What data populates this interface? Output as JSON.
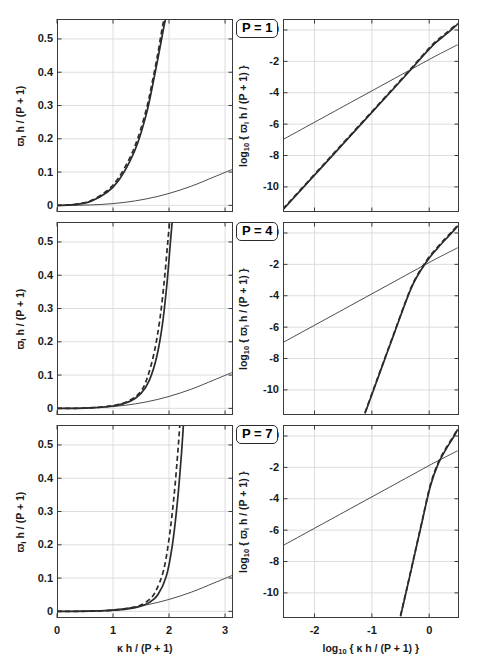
{
  "figure": {
    "title": "",
    "panel_labels": [
      "P = 1",
      "P = 4",
      "P = 7"
    ]
  },
  "axes": {
    "left": {
      "ylabel_html": "&#x3D6;<sub>i</sub> h / (P + 1)",
      "ylabel_plain": "w_i h / (P + 1)",
      "xlabel_html": "&#x3BA; h / (P + 1)",
      "xlabel_plain": "kappa h / (P + 1)",
      "xticks": [
        "0",
        "1",
        "2",
        "3"
      ],
      "yticks": [
        "0",
        "0.1",
        "0.2",
        "0.3",
        "0.4",
        "0.5"
      ],
      "xlim": [
        0,
        3.14159
      ],
      "ylim": [
        -0.02,
        0.56
      ]
    },
    "right": {
      "ylabel_html": "log<sub>10</sub> { &#x3D6;<sub>i</sub> h / (P + 1) }",
      "ylabel_plain": "log10 { w_i h / (P + 1) }",
      "xlabel_html": "log<sub>10</sub> { &#x3BA; h / (P + 1) }",
      "xlabel_plain": "log10 { kappa h / (P + 1) }",
      "xticks": [
        "-2",
        "-1",
        "0"
      ],
      "yticks": [
        "0",
        "-2",
        "-4",
        "-6",
        "-8",
        "-10"
      ],
      "xlim": [
        -2.55,
        0.52
      ],
      "ylim": [
        -11.6,
        0.7
      ]
    }
  },
  "chart_data": {
    "type": "line",
    "xlabel": "kappa h / (P + 1)",
    "ylabel": "w_i h / (P + 1)",
    "panels": [
      {
        "label": "P = 1",
        "linear": {
          "xlabel": "kappa h / (P + 1)",
          "ylabel": "w_i h / (P + 1)",
          "xlim": [
            0,
            3.14159
          ],
          "ylim": [
            -0.02,
            0.56
          ],
          "xticks": [
            0,
            1,
            2,
            3
          ],
          "yticks": [
            0,
            0.1,
            0.2,
            0.3,
            0.4,
            0.5
          ],
          "grid": true,
          "series": [
            {
              "name": "exact-shallow",
              "style": "solid-thin",
              "x": [
                0,
                0.4,
                0.8,
                1.2,
                1.6,
                2.0,
                2.4,
                2.8,
                3.14159
              ],
              "y": [
                0.0,
                0.0004,
                0.0028,
                0.0088,
                0.0195,
                0.0358,
                0.0578,
                0.0851,
                0.109
              ]
            },
            {
              "name": "approximation-solid",
              "style": "solid-bold",
              "x": [
                0,
                0.3,
                0.6,
                0.9,
                1.1,
                1.3,
                1.45,
                1.6,
                1.7,
                1.8,
                1.9,
                1.95
              ],
              "y": [
                0.0,
                0.002,
                0.012,
                0.04,
                0.075,
                0.132,
                0.192,
                0.278,
                0.355,
                0.44,
                0.53,
                0.57
              ]
            },
            {
              "name": "approximation-dashed",
              "style": "dashed",
              "x": [
                0,
                0.3,
                0.6,
                0.9,
                1.1,
                1.3,
                1.45,
                1.6,
                1.7,
                1.8,
                1.88,
                1.93
              ],
              "y": [
                0.0,
                0.0022,
                0.014,
                0.045,
                0.083,
                0.143,
                0.205,
                0.292,
                0.37,
                0.456,
                0.535,
                0.575
              ]
            }
          ]
        },
        "loglog": {
          "xlabel": "log10 { kappa h / (P + 1) }",
          "ylabel": "log10 { w_i h / (P + 1) }",
          "xlim": [
            -2.55,
            0.52
          ],
          "ylim": [
            -11.6,
            0.7
          ],
          "xticks": [
            -2,
            -1,
            0
          ],
          "yticks": [
            0,
            -2,
            -4,
            -6,
            -8,
            -10
          ],
          "grid": true,
          "series": [
            {
              "name": "exact-shallow",
              "style": "solid-thin",
              "slope": 2.0,
              "x": [
                -2.55,
                -1.5,
                -0.5,
                0.0,
                0.25,
                0.497
              ],
              "y": [
                -6.98,
                -4.88,
                -2.88,
                -1.88,
                -1.4,
                -0.94
              ]
            },
            {
              "name": "approximation-solid",
              "style": "solid-bold",
              "slope": 4.0,
              "x": [
                -2.55,
                -1.8,
                -1.0,
                -0.4,
                -0.1,
                0.1,
                0.3,
                0.497
              ],
              "y": [
                -11.45,
                -8.45,
                -5.25,
                -2.85,
                -1.62,
                -0.85,
                -0.25,
                0.38
              ]
            },
            {
              "name": "approximation-dashed",
              "style": "dashed",
              "slope": 4.0,
              "x": [
                -2.55,
                -1.8,
                -1.0,
                -0.4,
                -0.1,
                0.1,
                0.3,
                0.497
              ],
              "y": [
                -11.4,
                -8.4,
                -5.2,
                -2.8,
                -1.56,
                -0.78,
                -0.18,
                0.42
              ]
            }
          ]
        }
      },
      {
        "label": "P = 4",
        "linear": {
          "xlabel": "kappa h / (P + 1)",
          "ylabel": "w_i h / (P + 1)",
          "xlim": [
            0,
            3.14159
          ],
          "ylim": [
            -0.02,
            0.56
          ],
          "xticks": [
            0,
            1,
            2,
            3
          ],
          "yticks": [
            0,
            0.1,
            0.2,
            0.3,
            0.4,
            0.5
          ],
          "grid": true,
          "series": [
            {
              "name": "exact-shallow",
              "style": "solid-thin",
              "x": [
                0,
                0.4,
                0.8,
                1.2,
                1.6,
                2.0,
                2.4,
                2.8,
                3.14159
              ],
              "y": [
                0.0,
                0.0004,
                0.0028,
                0.0088,
                0.0195,
                0.0358,
                0.0578,
                0.0851,
                0.109
              ]
            },
            {
              "name": "approximation-solid",
              "style": "solid-bold",
              "x": [
                0,
                0.5,
                1.0,
                1.3,
                1.5,
                1.65,
                1.78,
                1.88,
                1.96,
                2.02,
                2.06
              ],
              "y": [
                0.0,
                0.0008,
                0.007,
                0.021,
                0.045,
                0.085,
                0.155,
                0.25,
                0.37,
                0.49,
                0.57
              ]
            },
            {
              "name": "approximation-dashed",
              "style": "dashed",
              "x": [
                0,
                0.5,
                1.0,
                1.3,
                1.5,
                1.62,
                1.74,
                1.84,
                1.92,
                1.98,
                2.02
              ],
              "y": [
                0.0,
                0.0009,
                0.008,
                0.024,
                0.052,
                0.096,
                0.172,
                0.272,
                0.392,
                0.505,
                0.578
              ]
            }
          ]
        },
        "loglog": {
          "xlabel": "log10 { kappa h / (P + 1) }",
          "ylabel": "log10 { w_i h / (P + 1) }",
          "xlim": [
            -2.55,
            0.52
          ],
          "ylim": [
            -11.6,
            0.7
          ],
          "xticks": [
            -2,
            -1,
            0
          ],
          "yticks": [
            0,
            -2,
            -4,
            -6,
            -8,
            -10
          ],
          "grid": true,
          "series": [
            {
              "name": "exact-shallow",
              "style": "solid-thin",
              "slope": 2.0,
              "x": [
                -2.55,
                -1.5,
                -0.5,
                0.0,
                0.25,
                0.497
              ],
              "y": [
                -6.98,
                -4.88,
                -2.88,
                -1.88,
                -1.4,
                -0.94
              ]
            },
            {
              "name": "approximation-solid",
              "style": "solid-bold",
              "slope": 10.0,
              "x": [
                -1.12,
                -0.9,
                -0.6,
                -0.3,
                -0.05,
                0.15,
                0.3,
                0.42,
                0.497
              ],
              "y": [
                -11.5,
                -9.3,
                -6.3,
                -3.4,
                -1.85,
                -0.95,
                -0.35,
                0.12,
                0.45
              ]
            },
            {
              "name": "approximation-dashed",
              "style": "dashed",
              "slope": 10.0,
              "x": [
                -1.12,
                -0.9,
                -0.6,
                -0.3,
                -0.05,
                0.15,
                0.3,
                0.42,
                0.497
              ],
              "y": [
                -11.45,
                -9.25,
                -6.25,
                -3.35,
                -1.78,
                -0.88,
                -0.28,
                0.18,
                0.5
              ]
            }
          ]
        }
      },
      {
        "label": "P = 7",
        "linear": {
          "xlabel": "kappa h / (P + 1)",
          "ylabel": "w_i h / (P + 1)",
          "xlim": [
            0,
            3.14159
          ],
          "ylim": [
            -0.02,
            0.56
          ],
          "xticks": [
            0,
            1,
            2,
            3
          ],
          "yticks": [
            0,
            0.1,
            0.2,
            0.3,
            0.4,
            0.5
          ],
          "grid": true,
          "series": [
            {
              "name": "exact-shallow",
              "style": "solid-thin",
              "x": [
                0,
                0.4,
                0.8,
                1.2,
                1.6,
                2.0,
                2.4,
                2.8,
                3.14159
              ],
              "y": [
                0.0,
                0.0004,
                0.0028,
                0.0088,
                0.0195,
                0.0358,
                0.0578,
                0.0851,
                0.109
              ]
            },
            {
              "name": "approximation-solid",
              "style": "solid-bold",
              "x": [
                0,
                0.6,
                1.1,
                1.45,
                1.65,
                1.8,
                1.95,
                2.06,
                2.15,
                2.22,
                2.26
              ],
              "y": [
                0.0,
                0.0005,
                0.004,
                0.013,
                0.027,
                0.05,
                0.105,
                0.2,
                0.33,
                0.47,
                0.57
              ]
            },
            {
              "name": "approximation-dashed",
              "style": "dashed",
              "x": [
                0,
                0.6,
                1.1,
                1.45,
                1.63,
                1.76,
                1.9,
                2.0,
                2.09,
                2.16,
                2.2
              ],
              "y": [
                0.0,
                0.0006,
                0.005,
                0.016,
                0.033,
                0.06,
                0.122,
                0.218,
                0.348,
                0.486,
                0.578
              ]
            }
          ]
        },
        "loglog": {
          "xlabel": "log10 { kappa h / (P + 1) }",
          "ylabel": "log10 { w_i h / (P + 1) }",
          "xlim": [
            -2.55,
            0.52
          ],
          "ylim": [
            -11.6,
            0.7
          ],
          "xticks": [
            -2,
            -1,
            0
          ],
          "yticks": [
            0,
            -2,
            -4,
            -6,
            -8,
            -10
          ],
          "grid": true,
          "series": [
            {
              "name": "exact-shallow",
              "style": "solid-thin",
              "slope": 2.0,
              "x": [
                -2.55,
                -1.5,
                -0.5,
                0.0,
                0.25,
                0.497
              ],
              "y": [
                -6.98,
                -4.88,
                -2.88,
                -1.88,
                -1.4,
                -0.94
              ]
            },
            {
              "name": "approximation-solid",
              "style": "solid-bold",
              "slope": 16.0,
              "x": [
                -0.5,
                -0.38,
                -0.25,
                -0.12,
                0.02,
                0.16,
                0.3,
                0.42,
                0.497
              ],
              "y": [
                -11.5,
                -9.6,
                -7.5,
                -5.4,
                -3.2,
                -1.75,
                -0.8,
                -0.1,
                0.42
              ]
            },
            {
              "name": "approximation-dashed",
              "style": "dashed",
              "slope": 16.0,
              "x": [
                -0.5,
                -0.38,
                -0.25,
                -0.12,
                0.02,
                0.16,
                0.3,
                0.42,
                0.497
              ],
              "y": [
                -11.45,
                -9.55,
                -7.45,
                -5.35,
                -3.12,
                -1.68,
                -0.73,
                -0.04,
                0.46
              ]
            }
          ]
        }
      }
    ]
  },
  "colors": {
    "axis": "#3a3a3a",
    "grid": "#d9d9d9",
    "curve": "#2b2b2b",
    "background": "#ffffff"
  }
}
